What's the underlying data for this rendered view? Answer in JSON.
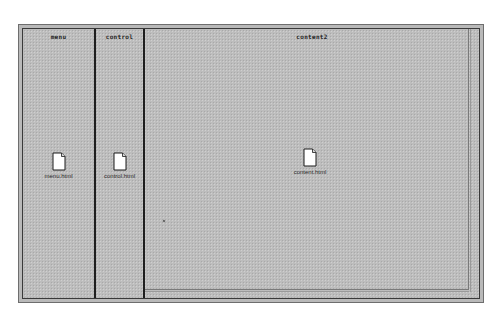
{
  "frameset": {
    "frames": [
      {
        "name": "menu",
        "file": "menu.html"
      },
      {
        "name": "control",
        "file": "control.html"
      },
      {
        "name": "content2",
        "file": "content.html"
      }
    ]
  },
  "icons": {
    "file": "document-icon"
  },
  "colors": {
    "frame_bg": "#bdbdbd",
    "divider": "#1f1f1f",
    "outer_border": "#6e6e6e",
    "icon_fill": "#ffffff"
  }
}
